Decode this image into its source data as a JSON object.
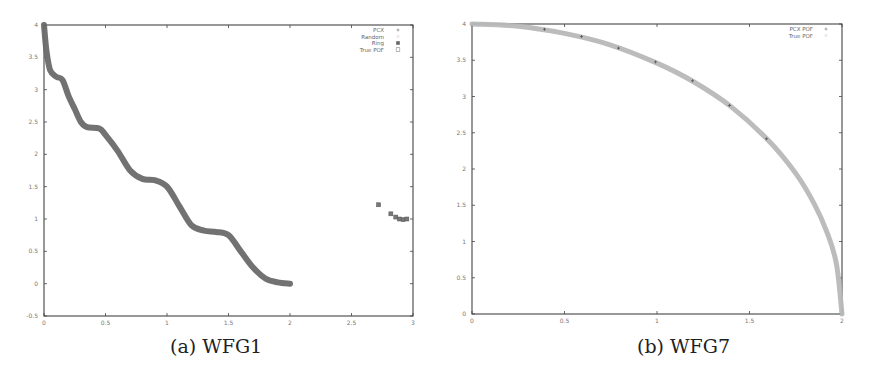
{
  "chart_data": [
    {
      "type": "scatter",
      "caption": "(a) WFG1",
      "title": "",
      "xlabel": "",
      "ylabel": "",
      "xlim": [
        0,
        3
      ],
      "ylim": [
        -0.5,
        4
      ],
      "xticks": [
        "0",
        "0.5",
        "1",
        "1.5",
        "2",
        "2.5",
        "3"
      ],
      "yticks": [
        "-0.5",
        "0",
        "0.5",
        "1",
        "1.5",
        "2",
        "2.5",
        "3",
        "3.5",
        "4"
      ],
      "grid": false,
      "legend_position": "top-right",
      "legend": [
        {
          "label": "PCX",
          "marker": "+"
        },
        {
          "label": "Random",
          "marker": "x"
        },
        {
          "label": "Ring",
          "marker": "*"
        },
        {
          "label": "True POF",
          "marker": "square"
        }
      ],
      "series": [
        {
          "name": "True POF",
          "description": "staircase-like wavy front from (0,4) down to (2,0)",
          "points": [
            [
              0,
              4.0
            ],
            [
              0.02,
              3.6
            ],
            [
              0.05,
              3.3
            ],
            [
              0.1,
              3.2
            ],
            [
              0.15,
              3.15
            ],
            [
              0.2,
              2.9
            ],
            [
              0.25,
              2.7
            ],
            [
              0.3,
              2.5
            ],
            [
              0.35,
              2.42
            ],
            [
              0.45,
              2.4
            ],
            [
              0.5,
              2.3
            ],
            [
              0.6,
              2.05
            ],
            [
              0.7,
              1.75
            ],
            [
              0.8,
              1.62
            ],
            [
              0.9,
              1.6
            ],
            [
              1.0,
              1.5
            ],
            [
              1.1,
              1.2
            ],
            [
              1.2,
              0.9
            ],
            [
              1.3,
              0.82
            ],
            [
              1.4,
              0.8
            ],
            [
              1.5,
              0.75
            ],
            [
              1.6,
              0.5
            ],
            [
              1.7,
              0.25
            ],
            [
              1.8,
              0.08
            ],
            [
              1.9,
              0.02
            ],
            [
              2.0,
              0.0
            ]
          ]
        },
        {
          "name": "Ring",
          "points": [
            [
              2.72,
              1.22
            ],
            [
              2.82,
              1.08
            ],
            [
              2.86,
              1.03
            ],
            [
              2.89,
              1.0
            ],
            [
              2.92,
              0.99
            ],
            [
              2.95,
              1.0
            ]
          ]
        }
      ]
    },
    {
      "type": "scatter",
      "caption": "(b) WFG7",
      "title": "",
      "xlabel": "",
      "ylabel": "",
      "xlim": [
        0,
        2
      ],
      "ylim": [
        0,
        4
      ],
      "xticks": [
        "0",
        "0.5",
        "1",
        "1.5",
        "2"
      ],
      "yticks": [
        "0",
        "0.5",
        "1",
        "1.5",
        "2",
        "2.5",
        "3",
        "3.5",
        "4"
      ],
      "grid": false,
      "legend_position": "top-right",
      "legend": [
        {
          "label": "PCX POF",
          "marker": "+"
        },
        {
          "label": "True POF",
          "marker": "x"
        }
      ],
      "series": [
        {
          "name": "True POF",
          "description": "concave quarter-ellipse (x/2)^2 + (y/4)^2 = 1",
          "points": [
            [
              0,
              4.0
            ],
            [
              0.25,
              3.97
            ],
            [
              0.5,
              3.87
            ],
            [
              0.75,
              3.71
            ],
            [
              1.0,
              3.46
            ],
            [
              1.2,
              3.2
            ],
            [
              1.4,
              2.86
            ],
            [
              1.6,
              2.4
            ],
            [
              1.75,
              1.94
            ],
            [
              1.85,
              1.52
            ],
            [
              1.92,
              1.12
            ],
            [
              1.97,
              0.69
            ],
            [
              2.0,
              0.0
            ]
          ]
        },
        {
          "name": "PCX POF",
          "points": [
            [
              0.4,
              3.92
            ],
            [
              0.6,
              3.82
            ],
            [
              0.8,
              3.66
            ],
            [
              1.0,
              3.47
            ],
            [
              1.2,
              3.21
            ],
            [
              1.4,
              2.87
            ],
            [
              1.6,
              2.41
            ]
          ]
        }
      ]
    }
  ],
  "captions": {
    "a": "(a) WFG1",
    "b": "(b) WFG7"
  },
  "colors": {
    "axis": "#444444",
    "curve_a": "#6a6a6a",
    "curve_b": "#b8b8b8",
    "pcx_b": "#555555",
    "tick_text": "#777777"
  }
}
